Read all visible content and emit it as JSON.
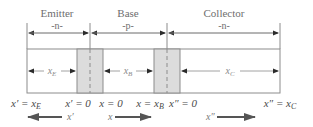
{
  "diagram": {
    "regions": [
      {
        "name": "Emitter",
        "type": "-n-",
        "width_symbol": "x",
        "width_sub": "E"
      },
      {
        "name": "Base",
        "type": "-p-",
        "width_symbol": "x",
        "width_sub": "B"
      },
      {
        "name": "Collector",
        "type": "-n-",
        "width_symbol": "x",
        "width_sub": "C"
      }
    ],
    "coordinates": [
      {
        "text_main": "x′ = x",
        "text_sub": "E"
      },
      {
        "text_main": "x′ = 0",
        "text_sub": ""
      },
      {
        "text_main": "x = 0",
        "text_sub": ""
      },
      {
        "text_main": "x = x",
        "text_sub": "B"
      },
      {
        "text_main": "x″ = 0",
        "text_sub": ""
      },
      {
        "text_main": "x″ = x",
        "text_sub": "C"
      }
    ],
    "axes": [
      {
        "label": "x′",
        "direction": "left"
      },
      {
        "label": "x",
        "direction": "right"
      },
      {
        "label": "x″",
        "direction": "right"
      }
    ],
    "colors": {
      "line": "#8c8c8c",
      "arrow": "#2b2b2b",
      "depletion_fill": "#dcdcdc",
      "text": "#6e6e6e"
    }
  }
}
